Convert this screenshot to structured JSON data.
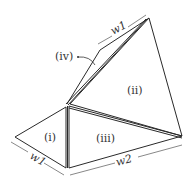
{
  "diagram": {
    "regions": [
      {
        "id": "i",
        "label": "(i)"
      },
      {
        "id": "ii",
        "label": "(ii)"
      },
      {
        "id": "iii",
        "label": "(iii)"
      },
      {
        "id": "iv",
        "label": "(iv)"
      }
    ],
    "dimensions": [
      {
        "id": "w1_top",
        "label": "w1"
      },
      {
        "id": "w1_left",
        "label": "w1"
      },
      {
        "id": "w2_bottom",
        "label": "w2"
      }
    ],
    "colors": {
      "stroke": "#2a2a2a",
      "text": "#333333",
      "background": "#ffffff"
    }
  }
}
